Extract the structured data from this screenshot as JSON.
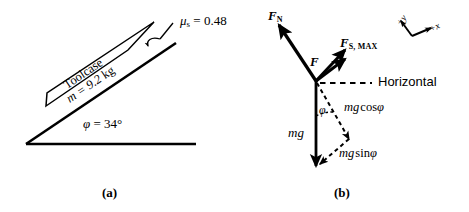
{
  "figure": {
    "panel_a": {
      "caption": "(a)",
      "friction_label": {
        "symbol": "μ",
        "subscript": "s",
        "equals": " = 0.48"
      },
      "object_name": "Toolcase",
      "mass_label": {
        "var": "m",
        "value": " = 9.2 ",
        "unit": "kg"
      },
      "angle_label": {
        "symbol": "φ",
        "value": " = 34°"
      }
    },
    "panel_b": {
      "caption": "(b)",
      "normal_force": {
        "symbol": "F",
        "subscript": "N"
      },
      "applied_force": {
        "symbol": "F"
      },
      "friction_force": {
        "symbol": "F",
        "subscript": "S, MAX"
      },
      "horizontal_line_label": "Horizontal",
      "weight_label": "mg",
      "angle_marker": "φ",
      "cos_component": {
        "prefix": "mg",
        "fn": "cos",
        "angle": "φ"
      },
      "sin_component": {
        "prefix": "mg",
        "fn": "sin",
        "angle": "φ"
      },
      "axes": {
        "y_label": "+y",
        "x_label": "+x"
      }
    }
  },
  "colors": {
    "stroke": "#000000",
    "background": "#ffffff"
  }
}
